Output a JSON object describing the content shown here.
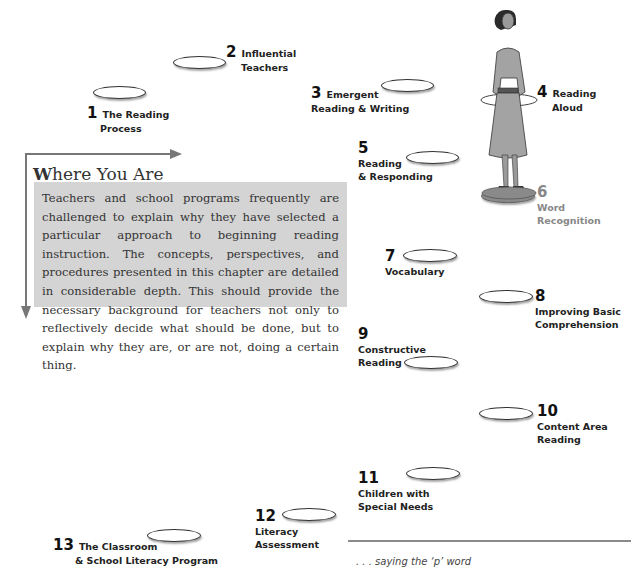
{
  "sidebar_box": {
    "title_initial": "W",
    "title_rest": "here You Are",
    "body": "Teachers and school programs frequently are challenged to explain why they have selected a particular approach to beginning reading instruction. The concepts, perspectives, and procedures presented in this chapter are detailed in considerable depth. This should provide the necessary background for teachers not only to reflectively decide what should be done, but to explain why they are, or are not, doing a certain thing."
  },
  "chapters": [
    {
      "number": "1",
      "line1": "The Reading",
      "line2": "Process"
    },
    {
      "number": "2",
      "line1": "Influential",
      "line2": "Teachers"
    },
    {
      "number": "3",
      "line1": "Emergent",
      "line2": "Reading & Writing"
    },
    {
      "number": "4",
      "line1": "Reading",
      "line2": "Aloud"
    },
    {
      "number": "5",
      "line1": "Reading",
      "line2": "& Responding"
    },
    {
      "number": "6",
      "line1": "Word",
      "line2": "Recognition"
    },
    {
      "number": "7",
      "line1": "Vocabulary",
      "line2": ""
    },
    {
      "number": "8",
      "line1": "Improving Basic",
      "line2": "Comprehension"
    },
    {
      "number": "9",
      "line1": "Constructive",
      "line2": "Reading"
    },
    {
      "number": "10",
      "line1": "Content Area",
      "line2": "Reading"
    },
    {
      "number": "11",
      "line1": "Children with",
      "line2": "Special Needs"
    },
    {
      "number": "12",
      "line1": "Literacy",
      "line2": "Assessment"
    },
    {
      "number": "13",
      "line1": "The Classroom",
      "line2": "& School Literacy Program"
    }
  ],
  "footer": {
    "caption": ". . . saying the ‘p’ word"
  },
  "colors": {
    "box_bg": "#d4d4d4",
    "arrow": "#777777",
    "current_stop": "#888888"
  }
}
